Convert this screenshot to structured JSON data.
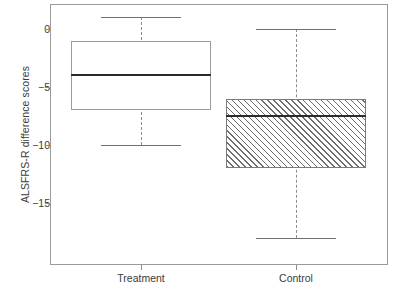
{
  "chart_data": {
    "type": "box",
    "title": "",
    "xlabel": "",
    "ylabel": "ALSFRS-R difference scores",
    "ylim": [
      -19.5,
      2.0
    ],
    "yticks": [
      0,
      -5,
      -10,
      -15
    ],
    "ytick_labels": [
      "0",
      "−5",
      "−10",
      "−15"
    ],
    "grid": false,
    "legend": null,
    "categories": [
      "Treatment",
      "Control"
    ],
    "boxes": [
      {
        "name": "Treatment",
        "fill": "white",
        "pattern": "none",
        "whisker_high": 1,
        "q3": -1,
        "median": -4,
        "q1": -7,
        "whisker_low": -10
      },
      {
        "name": "Control",
        "fill": "hatched",
        "pattern": "diagonal-45",
        "whisker_high": 0,
        "q3": -6,
        "median": -7.5,
        "q1": -12,
        "whisker_low": -18
      }
    ]
  },
  "axis": {
    "y_title": "ALSFRS-R difference scores",
    "y_tick_0": "0",
    "y_tick_1": "−5",
    "y_tick_2": "−10",
    "y_tick_3": "−15",
    "x_tick_0": "Treatment",
    "x_tick_1": "Control"
  },
  "colors": {
    "frame": "#9a9a9a",
    "box_outline": "#9b9b9b",
    "median": "#2b2b2b",
    "whisker": "#8d8d8d",
    "hatch": "#6e6e6e",
    "text": "#3b3b3b",
    "background": "#ffffff"
  }
}
